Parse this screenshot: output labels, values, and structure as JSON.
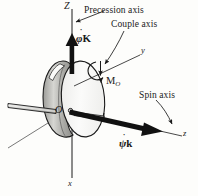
{
  "figure": {
    "background_color": "#fdfdfb",
    "ink_color": "#1a1a1a"
  },
  "annotations": {
    "precession_axis_label": "Precession axis",
    "couple_axis_label": "Couple axis",
    "spin_axis_label": "Spin axis"
  },
  "axes": {
    "big_z": "Z",
    "small_y": "y",
    "small_z": "z",
    "small_x": "x",
    "origin": "O"
  },
  "vectors": {
    "precession": {
      "symbol": "φ",
      "dot": "˙",
      "unit": "K"
    },
    "spin": {
      "symbol": "ψ",
      "dot": "˙",
      "unit": "k"
    },
    "moment": {
      "symbol": "M",
      "subscript": "O"
    }
  },
  "colors": {
    "disk_fill": "#f2f2f0",
    "disk_rim": "#b8b8b4",
    "outline": "#1a1a1a",
    "shaft": "#dcdcda"
  }
}
